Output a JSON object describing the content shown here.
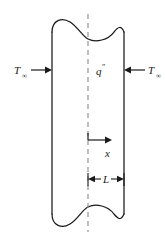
{
  "figure": {
    "type": "engineering-schematic",
    "background_color": "#ffffff",
    "line_color": "#1a1a1a",
    "centerline_color": "#8a8a8a"
  },
  "labels": {
    "temp_left": {
      "symbol": "T",
      "subscript": "∞",
      "full": "T∞",
      "meaning": "free-stream fluid temperature, left side"
    },
    "temp_right": {
      "symbol": "T",
      "subscript": "∞",
      "full": "T∞",
      "meaning": "free-stream fluid temperature, right side"
    },
    "heat_generation": {
      "symbol": "q",
      "superscript": "″",
      "full": "q″",
      "meaning": "volumetric heat generation rate"
    },
    "axis": {
      "symbol": "x",
      "full": "x",
      "meaning": "coordinate measured from the midplane"
    },
    "dimension": {
      "symbol": "L",
      "full": "L",
      "meaning": "half-thickness of the plane wall"
    }
  },
  "geometry": {
    "slab_left_x": 52,
    "slab_right_x": 124,
    "slab_top_y": 26,
    "slab_bottom_y": 220,
    "centerline_x": 88,
    "centerline_top_y": 14,
    "centerline_bottom_y": 232
  },
  "annotations": {
    "left_arrow": {
      "direction": "right",
      "y": 70,
      "x_start": 32,
      "x_end": 52,
      "meaning": "convection toward wall from left"
    },
    "right_arrow": {
      "direction": "left",
      "y": 70,
      "x_start": 144,
      "x_end": 124,
      "meaning": "convection toward wall from right"
    },
    "x_axis_arrow": {
      "direction": "right",
      "y": 140,
      "x_start": 88,
      "x_end": 112,
      "meaning": "positive x direction from midplane"
    },
    "dimension_line": {
      "y": 179,
      "x_start": 88,
      "x_end": 124,
      "style": "outward-arrows",
      "meaning": "half-thickness L from midplane to right surface"
    }
  },
  "break_symbols": {
    "top": "s-curve-break",
    "bottom": "s-curve-break",
    "meaning": "wall extends indefinitely in the vertical direction"
  }
}
